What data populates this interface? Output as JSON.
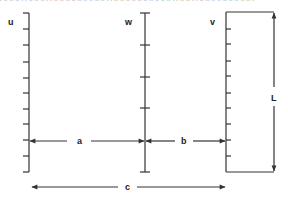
{
  "diagram": {
    "top_cropped_text": "AAAA AAAA AAAAAAAAAA AAAAAAAAAAA AAA AAAAAAAAAA",
    "stroke_color": "#333333",
    "axes": [
      {
        "id": "u",
        "label": "u",
        "x": 29,
        "y_top": 13,
        "y_bottom": 172,
        "tick_side": "left",
        "ticks": [
          13,
          29,
          45,
          62,
          78,
          93,
          109,
          124,
          140,
          156,
          172
        ]
      },
      {
        "id": "w",
        "label": "w",
        "x": 145,
        "y_top": 13,
        "y_bottom": 172,
        "tick_side": "both",
        "ticks": [
          13,
          45,
          77,
          108,
          172
        ]
      },
      {
        "id": "v",
        "label": "v",
        "x": 226,
        "y_top": 12,
        "y_bottom": 172,
        "tick_side": "right",
        "ticks": [
          29,
          44,
          61,
          76,
          93,
          108,
          124,
          140,
          156
        ]
      }
    ],
    "rectangle": {
      "x_left": 226,
      "x_right": 274,
      "y_top": 12,
      "y_bottom": 172
    },
    "dimensions": {
      "a": {
        "label": "a",
        "y": 141,
        "x1": 29,
        "x2": 145
      },
      "b": {
        "label": "b",
        "y": 141,
        "x1": 145,
        "x2": 226
      },
      "c": {
        "label": "c",
        "y": 187,
        "x1": 32,
        "x2": 225
      },
      "L": {
        "label": "L",
        "x": 274,
        "y1": 12,
        "y2": 172
      }
    }
  }
}
